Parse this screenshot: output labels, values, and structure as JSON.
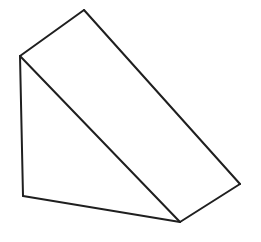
{
  "figure": {
    "background": "#ffffff",
    "stroke": "#1f1f1f",
    "stroke_width": 2,
    "vertices": {
      "top": [
        84,
        10
      ],
      "left_top": [
        20,
        56
      ],
      "left_bottom": [
        23,
        196
      ],
      "bottom": [
        180,
        222
      ],
      "right": [
        240,
        184
      ]
    },
    "edges": [
      {
        "name": "top-edge",
        "from": "left_top",
        "to": "top"
      },
      {
        "name": "slant-back-edge",
        "from": "top",
        "to": "right"
      },
      {
        "name": "right-bottom-edge",
        "from": "right",
        "to": "bottom"
      },
      {
        "name": "base-edge",
        "from": "bottom",
        "to": "left_bottom"
      },
      {
        "name": "left-vertical-edge",
        "from": "left_bottom",
        "to": "left_top"
      },
      {
        "name": "slant-front-edge",
        "from": "left_top",
        "to": "bottom"
      }
    ]
  }
}
